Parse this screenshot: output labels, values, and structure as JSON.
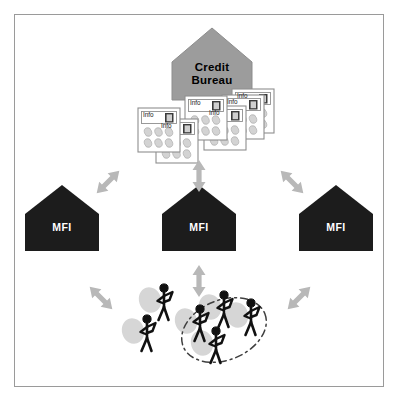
{
  "diagram": {
    "background_color": "#ffffff",
    "frame_color": "#9a9a9a",
    "arrow_color": "#b3b3b3",
    "house_fill_credit_bureau": "#9c9c9c",
    "house_fill_mfi": "#1c1c1c",
    "person_color": "#111111",
    "shadow_color": "#d0d0d0",
    "ellipse_color": "#4a4a4a"
  },
  "credit_bureau": {
    "label_line1": "Credit",
    "label_line2": "Bureau",
    "shape": "house"
  },
  "info_cards": {
    "card_label": "Info",
    "icon_name": "document-icon",
    "count": 6,
    "items": [
      {
        "label": "Info",
        "x": 139,
        "y": 108,
        "w": 42,
        "h": 44
      },
      {
        "label": "Info",
        "x": 156,
        "y": 119,
        "w": 42,
        "h": 44
      },
      {
        "label": "Info",
        "x": 186,
        "y": 96,
        "w": 44,
        "h": 46
      },
      {
        "label": "Info",
        "x": 206,
        "y": 106,
        "w": 42,
        "h": 44
      },
      {
        "label": "Info",
        "x": 224,
        "y": 91,
        "w": 42,
        "h": 44
      },
      {
        "label": "Info",
        "x": 235,
        "y": 89,
        "w": 42,
        "h": 46
      }
    ]
  },
  "mfis": [
    {
      "label": "MFI",
      "position": "left",
      "x": 26,
      "y": 196,
      "w": 72,
      "h": 54
    },
    {
      "label": "MFI",
      "position": "center",
      "x": 163,
      "y": 196,
      "w": 72,
      "h": 54
    },
    {
      "label": "MFI",
      "position": "right",
      "x": 300,
      "y": 196,
      "w": 72,
      "h": 54
    }
  ],
  "arrows": [
    {
      "name": "arrow-center-mfi-to-bureau",
      "orientation": "vertical",
      "x": 199,
      "y": 178
    },
    {
      "name": "arrow-left-mfi-to-bureau",
      "orientation": "diagonal-ne",
      "x": 109,
      "y": 180
    },
    {
      "name": "arrow-right-mfi-to-bureau",
      "orientation": "diagonal-nw",
      "x": 291,
      "y": 180
    },
    {
      "name": "arrow-center-mfi-to-clients",
      "orientation": "vertical",
      "x": 199,
      "y": 279
    },
    {
      "name": "arrow-left-mfi-to-clients",
      "orientation": "diagonal-se",
      "x": 100,
      "y": 297
    },
    {
      "name": "arrow-right-mfi-to-clients",
      "orientation": "diagonal-sw",
      "x": 298,
      "y": 297
    }
  ],
  "clients": {
    "group_outline": "dashed-ellipse",
    "people_count": 6,
    "people": [
      {
        "name": "client-figure",
        "x": 163,
        "y": 296,
        "inside_group": false
      },
      {
        "name": "client-figure",
        "x": 146,
        "y": 327,
        "inside_group": false
      },
      {
        "name": "client-figure",
        "x": 198,
        "y": 317,
        "inside_group": true
      },
      {
        "name": "client-figure",
        "x": 222,
        "y": 305,
        "inside_group": true
      },
      {
        "name": "client-figure",
        "x": 214,
        "y": 339,
        "inside_group": true
      },
      {
        "name": "client-figure",
        "x": 249,
        "y": 312,
        "inside_group": true
      }
    ],
    "ellipse": {
      "cx": 224,
      "cy": 330,
      "rx": 44,
      "ry": 30,
      "rotation": -22
    }
  }
}
